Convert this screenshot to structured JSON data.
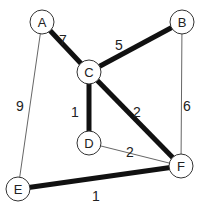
{
  "graph": {
    "nodes": [
      {
        "id": "A",
        "label": "A",
        "x": 42,
        "y": 22
      },
      {
        "id": "B",
        "label": "B",
        "x": 182,
        "y": 22
      },
      {
        "id": "C",
        "label": "C",
        "x": 89,
        "y": 72
      },
      {
        "id": "D",
        "label": "D",
        "x": 89,
        "y": 143
      },
      {
        "id": "E",
        "label": "E",
        "x": 18,
        "y": 189
      },
      {
        "id": "F",
        "label": "F",
        "x": 181,
        "y": 166
      }
    ],
    "edges": [
      {
        "from": "A",
        "to": "C",
        "weight": "7",
        "bold": true,
        "lx": 63,
        "ly": 40
      },
      {
        "from": "C",
        "to": "B",
        "weight": "5",
        "bold": true,
        "lx": 119,
        "ly": 45
      },
      {
        "from": "C",
        "to": "D",
        "weight": "1",
        "bold": true,
        "lx": 75,
        "ly": 112
      },
      {
        "from": "C",
        "to": "F",
        "weight": "2",
        "bold": true,
        "lx": 137,
        "ly": 112
      },
      {
        "from": "D",
        "to": "F",
        "weight": "2",
        "bold": false,
        "lx": 130,
        "ly": 152
      },
      {
        "from": "A",
        "to": "E",
        "weight": "9",
        "bold": false,
        "lx": 20,
        "ly": 106
      },
      {
        "from": "B",
        "to": "F",
        "weight": "6",
        "bold": false,
        "lx": 187,
        "ly": 106
      },
      {
        "from": "E",
        "to": "F",
        "weight": "1",
        "bold": true,
        "lx": 96,
        "ly": 196
      }
    ]
  },
  "colors": {
    "node_stroke": "#333333",
    "edge": "#111111",
    "thin_edge": "#666666"
  }
}
